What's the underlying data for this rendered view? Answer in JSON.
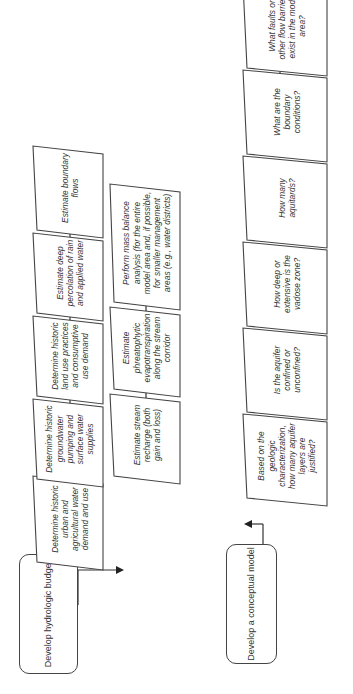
{
  "diagram": {
    "orientation": "rotated-90-ccw",
    "colors": {
      "stroke": "#444444",
      "text": "#333333",
      "background": "#ffffff"
    },
    "start_nodes": {
      "hydrologic": {
        "label": "Develop hydrologic budget"
      },
      "conceptual": {
        "label": "Develop a conceptual model"
      }
    },
    "hydrologic_row1": [
      {
        "label": "Determine historic urban and agricultural water demand and use"
      },
      {
        "label": "Determine historic groundwater pumping and surface water supplies"
      },
      {
        "label": "Determine historic land use practices and consumptive use demand"
      },
      {
        "label": "Estimate deep percolation of rain and applied water"
      },
      {
        "label": "Estimate boundary flows"
      }
    ],
    "hydrologic_row2": [
      {
        "label": "Estimate stream recharge (both gain and loss)"
      },
      {
        "label": "Estimate phreatophytic evapotranspiration along the stream corridor"
      },
      {
        "label": "Perform mass balance analysis (for the entire model area and, if possible, for smaller management areas (e.g., water districts)"
      }
    ],
    "conceptual_row": [
      {
        "label": "Based on the geologic characterization, how many aquifer layers are justified?"
      },
      {
        "label": "Is the aquifer confined or unconfined?"
      },
      {
        "label": "How deep or extensive is the vadose zone?"
      },
      {
        "label": "How many aquitards?"
      },
      {
        "label": "What are the boundary conditions?"
      },
      {
        "label": "What faults or other flow barriers exist in the model area?"
      }
    ]
  }
}
